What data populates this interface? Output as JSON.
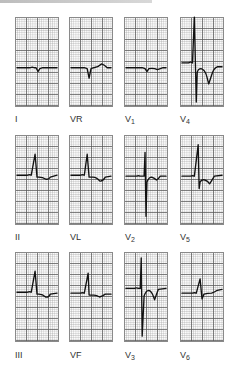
{
  "figure": {
    "type": "12-lead ECG",
    "layout": {
      "rows": 3,
      "columns": 4
    },
    "trace_color": "#111111",
    "grid_major_color": "#5a5a5a",
    "grid_minor_color": "#969696",
    "leads": [
      {
        "id": "I",
        "label": "I",
        "sub": "",
        "row": 0,
        "col": 0
      },
      {
        "id": "VR",
        "label": "VR",
        "sub": "",
        "row": 0,
        "col": 1
      },
      {
        "id": "V1",
        "label": "V",
        "sub": "1",
        "row": 0,
        "col": 2
      },
      {
        "id": "V4",
        "label": "V",
        "sub": "4",
        "row": 0,
        "col": 3
      },
      {
        "id": "II",
        "label": "II",
        "sub": "",
        "row": 1,
        "col": 0
      },
      {
        "id": "VL",
        "label": "VL",
        "sub": "",
        "row": 1,
        "col": 1
      },
      {
        "id": "V2",
        "label": "V",
        "sub": "2",
        "row": 1,
        "col": 2
      },
      {
        "id": "V5",
        "label": "V",
        "sub": "5",
        "row": 1,
        "col": 3
      },
      {
        "id": "III",
        "label": "III",
        "sub": "",
        "row": 2,
        "col": 0
      },
      {
        "id": "VF",
        "label": "VF",
        "sub": "",
        "row": 2,
        "col": 1
      },
      {
        "id": "V3",
        "label": "V",
        "sub": "3",
        "row": 2,
        "col": 2
      },
      {
        "id": "V6",
        "label": "V",
        "sub": "6",
        "row": 2,
        "col": 3
      }
    ]
  }
}
